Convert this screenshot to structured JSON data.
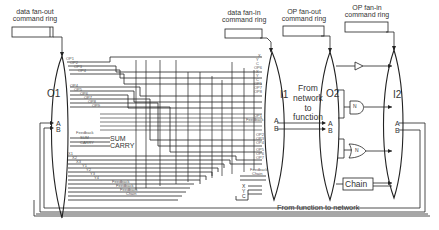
{
  "diagram": {
    "rings": {
      "data_fanout": {
        "line1": "data fan-out",
        "line2": "command ring"
      },
      "data_fanin": {
        "line1": "data fan-in",
        "line2": "command ring"
      },
      "op_fanout": {
        "line1": "OP fan-out",
        "line2": "command ring"
      },
      "op_fanin": {
        "line1": "OP fan-in",
        "line2": "command ring"
      }
    },
    "nodes": {
      "o1": "O1",
      "i1": "I1",
      "o2": "O2",
      "i2": "I2"
    },
    "ports": {
      "a": "A",
      "b": "B"
    },
    "o1_outputs_top": [
      "OP1",
      "OP2",
      "OP3",
      "OP4"
    ],
    "o1_outputs_mid": [
      "OP4",
      "OP5",
      "OP6",
      "OP7",
      "OP8",
      "OP9"
    ],
    "o1_sum_labels": {
      "feedback": "Feedback",
      "sum": "SUM",
      "carry": "CARRY",
      "sum_big": "SUM",
      "carry_big": "CARRY"
    },
    "o1_outputs_bottom": [
      "X1",
      "X2",
      "X3",
      "Y1",
      "Y2",
      "Y3",
      "Y4"
    ],
    "o1_feedback": [
      "Feedback",
      "Feedback",
      "Feedback",
      "Chain"
    ],
    "i1_inputs_top": [
      "X",
      "Y",
      "C",
      "OP6",
      "X",
      "Y",
      "C",
      "OP1",
      "OP7",
      "OP8"
    ],
    "i1_inputs_mid": [
      "OP1",
      "Feedback",
      "OP2",
      "OP3",
      "OP4",
      "OP5",
      "OP6",
      "OP7"
    ],
    "i1_inputs_bottom": [
      "Feedback",
      "Chain"
    ],
    "i1_xyc": [
      "X",
      "Y",
      "C"
    ],
    "texts": {
      "from_network": "From\nnetwork\nto\nfunction",
      "from_network_lines": [
        "From",
        "network",
        "to",
        "function"
      ],
      "from_function": "From function to network",
      "chain": "Chain",
      "gate_n": "N"
    },
    "colors": {
      "line": "#222222",
      "text": "#333333",
      "background": "#ffffff"
    }
  }
}
